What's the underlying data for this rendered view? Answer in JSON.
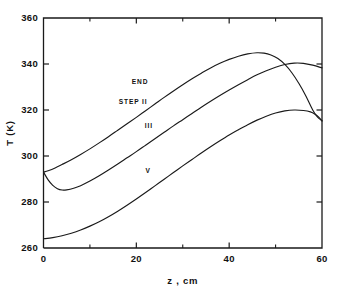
{
  "figure": {
    "background_color": "#ffffff",
    "ink_color": "#1a1a1a"
  },
  "chart_data": {
    "type": "line",
    "title": "",
    "subtitle": "",
    "xlabel": "z , cm",
    "ylabel": "T (K)",
    "xlim": [
      0,
      60
    ],
    "ylim": [
      260,
      360
    ],
    "grid": false,
    "legend_position": "inline-annotations",
    "x_ticks_major": [
      0,
      20,
      40,
      60
    ],
    "x_tick_labels": [
      "0",
      "20",
      "40",
      "60"
    ],
    "x_ticks_minor": [
      10,
      30,
      50
    ],
    "y_ticks_major": [
      260,
      280,
      300,
      320,
      340,
      360
    ],
    "y_tick_labels": [
      "260",
      "280",
      "300",
      "320",
      "340",
      "360"
    ],
    "y_ticks_minor": [],
    "annotations": [
      {
        "text": "END",
        "x": 19.0,
        "y": 331.5,
        "name": "curve-label-end"
      },
      {
        "text": "STEP II",
        "x": 16.2,
        "y": 322.8,
        "name": "curve-label-step-ii"
      },
      {
        "text": "III",
        "x": 21.8,
        "y": 312.0,
        "name": "curve-label-iii"
      },
      {
        "text": "V",
        "x": 22.0,
        "y": 292.5,
        "name": "curve-label-v"
      }
    ],
    "series": [
      {
        "name": "END STEP II",
        "label": "END STEP II",
        "x": [
          0,
          1,
          2.5,
          4,
          6,
          8,
          10,
          12,
          14,
          16,
          18,
          20,
          22,
          24,
          26,
          28,
          30,
          32,
          34,
          36,
          38,
          40,
          42,
          44,
          46,
          47.5,
          49,
          50.5,
          52,
          53.5,
          55,
          56.5,
          58,
          59,
          60
        ],
        "y": [
          293.0,
          293.6,
          294.8,
          296.3,
          298.4,
          300.7,
          303.1,
          305.7,
          308.4,
          311.2,
          314.0,
          316.8,
          319.7,
          322.6,
          325.5,
          328.3,
          331.0,
          333.6,
          336.0,
          338.3,
          340.3,
          342.0,
          343.4,
          344.4,
          344.9,
          344.7,
          343.9,
          342.4,
          339.8,
          336.2,
          331.6,
          326.2,
          320.0,
          317.0,
          315.3
        ]
      },
      {
        "name": "III",
        "label": "III",
        "x": [
          0,
          1,
          2,
          3,
          4,
          5,
          6.5,
          8,
          10,
          12,
          14,
          16,
          18,
          20,
          22,
          24,
          26,
          28,
          30,
          32,
          34,
          36,
          38,
          40,
          42,
          44,
          46,
          48,
          50,
          52,
          54,
          56,
          58,
          60
        ],
        "y": [
          293.0,
          289.6,
          287.2,
          285.8,
          285.2,
          285.3,
          286.0,
          287.1,
          289.1,
          291.4,
          293.9,
          296.5,
          299.2,
          301.9,
          304.7,
          307.5,
          310.3,
          313.1,
          315.8,
          318.5,
          321.2,
          323.8,
          326.3,
          328.7,
          331.0,
          333.2,
          335.3,
          337.1,
          338.6,
          339.8,
          340.4,
          340.3,
          339.5,
          338.3
        ]
      },
      {
        "name": "V",
        "label": "V",
        "x": [
          0,
          2,
          4,
          6,
          8,
          10,
          12,
          14,
          16,
          18,
          20,
          22,
          24,
          26,
          28,
          30,
          32,
          34,
          36,
          38,
          40,
          42,
          44,
          46,
          48,
          50,
          52,
          54,
          56,
          57.5,
          58.5,
          59.3,
          60
        ],
        "y": [
          264.0,
          264.5,
          265.3,
          266.4,
          267.8,
          269.5,
          271.4,
          273.6,
          276.0,
          278.6,
          281.3,
          284.1,
          287.0,
          289.9,
          292.8,
          295.7,
          298.5,
          301.3,
          304.0,
          306.6,
          309.1,
          311.4,
          313.6,
          315.6,
          317.3,
          318.7,
          319.6,
          320.0,
          319.8,
          319.2,
          318.2,
          316.9,
          315.3
        ]
      }
    ]
  }
}
